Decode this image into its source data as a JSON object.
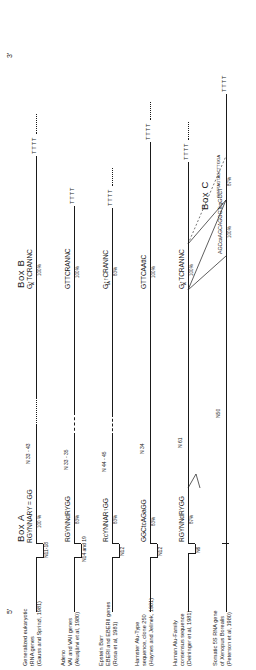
{
  "figure": {
    "title_end_left": "5'",
    "title_end_right": "3'",
    "box_a_title": "Box A",
    "box_b_title": "Box B",
    "box_c_title": "Box C",
    "terminator": "TTTT"
  },
  "rows": [
    {
      "label_lines": [
        "Generalized eukaryotic",
        "tRNA genes",
        "(Gauss and Sprinzl, 1981)"
      ],
      "lead_label": "N11-18",
      "box_a_seq": "RGYNNARY = GG",
      "box_a_pct": "100 %",
      "spacer": "N 33 - 43",
      "spacer_style": "dotted",
      "box_b_seq": "G↑TCRANNC",
      "box_b_sub": "A",
      "box_b_pct": "100%",
      "terminator": "TTTT",
      "has_intron_arrow": true
    },
    {
      "label_lines": [
        "Adeno",
        "VAI and VAII genes",
        "(Akusjärvi et al, 1980)"
      ],
      "lead_label": "N14 and 19",
      "box_a_seq": "RGYNNdRYGG",
      "box_a_pct": "83%",
      "spacer": "N 33 - 35",
      "spacer_style": "dashed",
      "box_b_seq": "GTTCRANNC",
      "box_b_sub": "",
      "box_b_pct": "100%",
      "terminator": "TTTT",
      "has_intron_arrow": true
    },
    {
      "label_lines": [
        "Epstein Barr",
        "EBERI and EBERII genes",
        "(Rosa et al, 1981)"
      ],
      "lead_label": "N12",
      "box_a_seq": "RcYNNAR↑GG",
      "box_a_pct": "83%",
      "spacer": "N 44 - 45",
      "spacer_style": "dashed",
      "box_b_seq": "G↑↑CRANNC",
      "box_b_sub": "TA",
      "box_b_pct": "83%",
      "terminator": "TTTT",
      "has_intron_arrow": false
    },
    {
      "label_lines": [
        "Hamster Alu-Type",
        "sequence, clone 250",
        "(Haynes and Jelinek, 1981)"
      ],
      "lead_label": "N12",
      "box_a_seq": "GGCtcAGaGG",
      "box_a_pct": "83%",
      "spacer": "N 34",
      "spacer_style": "solid",
      "box_b_seq": "GTTCAAttC",
      "box_b_sub": "",
      "box_b_pct": "100%",
      "terminator": "TTTT",
      "has_intron_arrow": false
    },
    {
      "label_lines": [
        "Human Alu-Family",
        "consensus sequence",
        "(Deininger et al, 1981)"
      ],
      "lead_label": "N6",
      "box_a_seq": "RGYNNdRYGG",
      "box_a_pct": "87%",
      "spacer": "N 61",
      "spacer_style": "solid",
      "box_b_seq": "G↑TCRANNC",
      "box_b_sub": "A",
      "box_b_pct": "100%",
      "terminator": "TTTT",
      "has_intron_arrow": false
    },
    {
      "label_lines": [
        "Somatic 5S RNA gene",
        "of Xenopus Borealis",
        "(Peterson et al, 1980)"
      ],
      "lead_label": "",
      "box_a_seq": "",
      "box_a_pct": "",
      "spacer": "N50",
      "spacer_style": "solid",
      "box_b_seq": "",
      "box_b_sub": "",
      "box_b_pct": "",
      "terminator": "TTTT",
      "has_intron_arrow": false
    }
  ],
  "box_c": {
    "left_seq": "AGCcaAGCAGGGTcgGCCT",
    "left_pct": "100%",
    "right_seq": "GGTTAGTAGCTTGGA",
    "right_pct": "87%"
  }
}
